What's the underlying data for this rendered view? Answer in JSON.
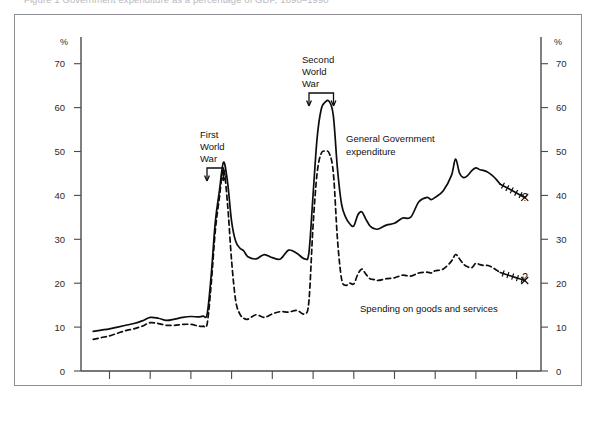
{
  "caption": {
    "text": "Figure 1   Government expenditure as a percentage of GDP, 1890–1990"
  },
  "chart_data": {
    "type": "line",
    "title": "",
    "subtitle": "",
    "xlabel": "",
    "ylabel": "%",
    "ylabel_right": "%",
    "xlim": [
      1883,
      1996
    ],
    "ylim": [
      0,
      76
    ],
    "grid": false,
    "legend_position": "inline-annotations",
    "y_ticks": [
      0,
      10,
      20,
      30,
      40,
      50,
      60,
      70
    ],
    "y_tick_labels": [
      "0",
      "10",
      "20",
      "30",
      "40",
      "50",
      "60",
      "70"
    ],
    "x_ticks": [
      1890,
      1900,
      1910,
      1920,
      1930,
      1940,
      1950,
      1960,
      1970,
      1980,
      1990
    ],
    "x_tick_labels": [
      "1890",
      "1900",
      "1910",
      "1920",
      "1930",
      "1940",
      "1950",
      "1960",
      "1970",
      "1980",
      "1990"
    ],
    "series": [
      {
        "name": "General Government expenditure",
        "style": "solid",
        "color": "#0d0d0d",
        "x": [
          1886,
          1888,
          1890,
          1892,
          1894,
          1896,
          1898,
          1900,
          1902,
          1904,
          1906,
          1908,
          1910,
          1912,
          1913,
          1914,
          1915,
          1916,
          1917,
          1918,
          1919,
          1920,
          1921,
          1922,
          1923,
          1924,
          1926,
          1928,
          1930,
          1932,
          1934,
          1936,
          1938,
          1939,
          1940,
          1941,
          1942,
          1943,
          1944,
          1945,
          1946,
          1947,
          1948,
          1949,
          1950,
          1951,
          1952,
          1953,
          1954,
          1955,
          1956,
          1958,
          1960,
          1962,
          1964,
          1966,
          1968,
          1969,
          1970,
          1972,
          1974,
          1975,
          1976,
          1977,
          1978,
          1979,
          1980,
          1981,
          1982,
          1983,
          1984,
          1985,
          1986
        ],
        "y": [
          9.0,
          9.3,
          9.6,
          10.0,
          10.4,
          10.8,
          11.4,
          12.2,
          12.0,
          11.5,
          11.8,
          12.2,
          12.4,
          12.3,
          12.5,
          13.0,
          22.0,
          34.0,
          41.0,
          47.5,
          43.0,
          34.0,
          29.5,
          28.0,
          27.3,
          26.0,
          25.5,
          26.5,
          25.8,
          25.5,
          27.5,
          26.8,
          25.5,
          27.0,
          40.0,
          53.0,
          59.5,
          61.2,
          61.3,
          58.0,
          46.0,
          38.0,
          35.0,
          33.5,
          33.0,
          35.5,
          36.2,
          34.5,
          33.0,
          32.4,
          32.3,
          33.2,
          33.6,
          34.8,
          35.0,
          38.5,
          39.5,
          39.0,
          39.5,
          41.0,
          44.5,
          48.2,
          45.0,
          44.0,
          44.5,
          45.6,
          46.2,
          45.8,
          45.6,
          45.2,
          44.5,
          43.6,
          42.5
        ],
        "forecast_x": [
          1986,
          1988,
          1990,
          1992
        ],
        "forecast_y": [
          42.5,
          41.5,
          40.5,
          39.5
        ],
        "forecast_marker": "?",
        "forecast_style": "hatched"
      },
      {
        "name": "Spending on goods and services",
        "style": "dashed",
        "color": "#0d0d0d",
        "x": [
          1886,
          1888,
          1890,
          1892,
          1894,
          1896,
          1898,
          1900,
          1902,
          1904,
          1906,
          1908,
          1910,
          1912,
          1913,
          1914,
          1915,
          1916,
          1917,
          1918,
          1919,
          1920,
          1921,
          1922,
          1923,
          1924,
          1926,
          1928,
          1930,
          1932,
          1934,
          1936,
          1938,
          1939,
          1940,
          1941,
          1942,
          1943,
          1944,
          1945,
          1946,
          1947,
          1948,
          1949,
          1950,
          1951,
          1952,
          1953,
          1954,
          1955,
          1956,
          1958,
          1960,
          1962,
          1964,
          1966,
          1968,
          1969,
          1970,
          1972,
          1974,
          1975,
          1976,
          1977,
          1978,
          1979,
          1980,
          1981,
          1982,
          1983,
          1984,
          1985,
          1986
        ],
        "y": [
          7.2,
          7.6,
          8.0,
          8.6,
          9.2,
          9.6,
          10.2,
          11.0,
          10.8,
          10.4,
          10.4,
          10.6,
          10.6,
          10.2,
          10.2,
          10.8,
          20.0,
          32.0,
          39.5,
          46.0,
          38.0,
          25.0,
          16.0,
          13.0,
          12.0,
          11.8,
          12.8,
          12.2,
          13.0,
          13.5,
          13.4,
          13.8,
          13.0,
          16.0,
          33.0,
          45.0,
          49.5,
          50.0,
          49.5,
          45.0,
          30.0,
          21.0,
          19.5,
          20.0,
          19.8,
          22.0,
          23.2,
          22.0,
          21.0,
          20.8,
          20.6,
          21.0,
          21.2,
          21.8,
          21.6,
          22.3,
          22.5,
          22.3,
          22.8,
          23.2,
          25.0,
          26.5,
          25.5,
          24.3,
          23.7,
          23.5,
          24.5,
          24.2,
          24.0,
          24.0,
          23.6,
          23.0,
          22.4
        ],
        "forecast_x": [
          1986,
          1988,
          1990,
          1992
        ],
        "forecast_y": [
          22.4,
          21.8,
          21.2,
          20.6
        ],
        "forecast_marker": "?",
        "forecast_style": "hatched"
      }
    ],
    "annotations": [
      {
        "id": "first-world-war",
        "lines": [
          "First",
          "World",
          "War"
        ],
        "bracket_x": [
          1914,
          1918
        ],
        "bracket_y": 50
      },
      {
        "id": "second-world-war",
        "lines": [
          "Second",
          "World",
          "War"
        ],
        "bracket_x": [
          1939,
          1945
        ],
        "bracket_y": 66
      }
    ],
    "series_callouts": [
      {
        "id": "general-government-expenditure",
        "lines": [
          "General Government",
          "expenditure"
        ]
      },
      {
        "id": "spending-on-goods-and-services",
        "lines": [
          "Spending on goods and services"
        ]
      }
    ],
    "forecast_question_marks": [
      "?",
      "?"
    ]
  }
}
